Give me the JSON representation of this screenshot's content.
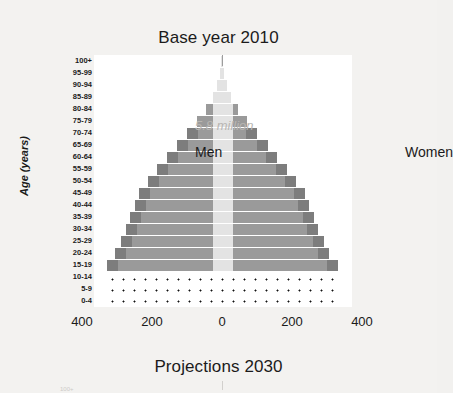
{
  "titles": {
    "top": "Base year 2010",
    "bottom": "Projections 2030"
  },
  "labels": {
    "annotation": "5.8 million",
    "men": "Men",
    "women": "Women",
    "y_axis_title": "Age (years)",
    "next_chart_hint": "100+"
  },
  "colors": {
    "bar_inner": "#9a9a9a",
    "bar_flank": "#7d7d7d",
    "page_background": "#f3f2f0",
    "plot_background": "#ffffff",
    "annotation_text": "#b8b6b3",
    "text": "#1b1b1b"
  },
  "chart_data": {
    "type": "bar",
    "subtype": "population-pyramid",
    "title": "Base year 2010",
    "subtitle": "Projections 2030",
    "annotation": "5.8 million",
    "xlabel": "",
    "ylabel": "Age (years)",
    "xlim": [
      -450,
      450
    ],
    "xticks": [
      -400,
      -200,
      0,
      200,
      400
    ],
    "xtick_labels": [
      "400",
      "200",
      "0",
      "200",
      "400"
    ],
    "grid": false,
    "legend_position": "inline",
    "categories": [
      "100+",
      "95-99",
      "90-94",
      "85-89",
      "80-84",
      "75-79",
      "70-74",
      "65-69",
      "60-64",
      "55-59",
      "50-54",
      "45-49",
      "40-44",
      "35-39",
      "30-34",
      "25-29",
      "20-24",
      "15-19",
      "10-14",
      "5-9",
      "0-4"
    ],
    "series": [
      {
        "name": "Men",
        "side": "left",
        "values": [
          3,
          7,
          14,
          27,
          47,
          72,
          100,
          130,
          158,
          185,
          212,
          238,
          248,
          262,
          275,
          290,
          305,
          330,
          335,
          335,
          335
        ]
      },
      {
        "name": "Women",
        "side": "right",
        "values": [
          3,
          7,
          14,
          27,
          47,
          72,
          100,
          130,
          158,
          185,
          212,
          238,
          248,
          262,
          275,
          290,
          305,
          330,
          335,
          335,
          335
        ]
      }
    ],
    "stippled_categories": [
      "10-14",
      "5-9",
      "0-4"
    ]
  }
}
